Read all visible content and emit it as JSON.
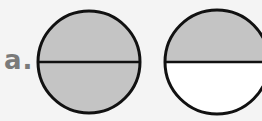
{
  "problem": {
    "label": "a.",
    "figures": [
      {
        "name": "circle-1",
        "parts": 2,
        "shaded": 2
      },
      {
        "name": "circle-2",
        "parts": 2,
        "shaded": 1
      }
    ]
  },
  "colors": {
    "shade": "#c4c4c4",
    "stroke": "#111111",
    "background": "#f4f4f4",
    "label": "#7a7a7a"
  }
}
